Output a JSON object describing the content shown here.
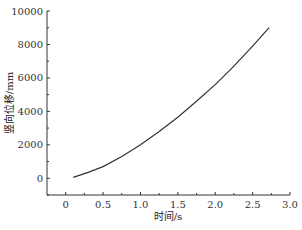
{
  "chart_data": {
    "type": "line",
    "title": "",
    "xlabel": "时间/s",
    "ylabel": "竖向位移/mm",
    "xlim": [
      -0.25,
      3.0
    ],
    "ylim": [
      -1000,
      10000
    ],
    "xticks": [
      "0",
      "0.5",
      "1.0",
      "1.5",
      "2.0",
      "2.5",
      "3.0"
    ],
    "yticks": [
      "0",
      "2000",
      "4000",
      "6000",
      "8000",
      "10000"
    ],
    "grid": false,
    "legend": null,
    "series": [
      {
        "name": "竖向位移",
        "x": [
          0.1,
          0.3,
          0.5,
          0.75,
          1.0,
          1.25,
          1.5,
          1.75,
          2.0,
          2.25,
          2.5,
          2.72
        ],
        "y": [
          50,
          350,
          700,
          1300,
          2000,
          2800,
          3650,
          4600,
          5600,
          6700,
          7900,
          9000
        ]
      }
    ]
  }
}
